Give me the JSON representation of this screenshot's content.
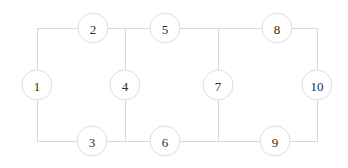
{
  "figure": {
    "title": "",
    "background_color": "#ffffff",
    "width": 348,
    "height": 168
  },
  "graph": {
    "type": "undirected-graph",
    "node_count": 10,
    "edge_count": 13,
    "node_radius": 15,
    "node_fill": "#ffffff",
    "node_stroke": "#dcdcdc",
    "edge_stroke": "#d9d9d9",
    "label_color": "#2b2b2b",
    "nodes": [
      {
        "id": "1",
        "label": "1",
        "x": 37,
        "y": 85
      },
      {
        "id": "2",
        "label": "2",
        "x": 93,
        "y": 28
      },
      {
        "id": "3",
        "label": "3",
        "x": 92,
        "y": 141
      },
      {
        "id": "4",
        "label": "4",
        "x": 125,
        "y": 85
      },
      {
        "id": "5",
        "label": "5",
        "x": 165,
        "y": 28
      },
      {
        "id": "6",
        "label": "6",
        "x": 165,
        "y": 141
      },
      {
        "id": "7",
        "label": "7",
        "x": 218,
        "y": 85
      },
      {
        "id": "8",
        "label": "8",
        "x": 277,
        "y": 28
      },
      {
        "id": "9",
        "label": "9",
        "x": 275,
        "y": 141
      },
      {
        "id": "10",
        "label": "10",
        "x": 317,
        "y": 85
      }
    ],
    "edges": [
      {
        "from": "1",
        "to": "2",
        "path": "M 37 85 L 37 28 L 93 28"
      },
      {
        "from": "1",
        "to": "3",
        "path": "M 37 85 L 37 141 L 92 141"
      },
      {
        "from": "2",
        "to": "4",
        "path": "M 93 28 L 125 28 L 125 85"
      },
      {
        "from": "2",
        "to": "5",
        "path": "M 93 28 L 165 28"
      },
      {
        "from": "3",
        "to": "4",
        "path": "M 92 141 L 125 141 L 125 85"
      },
      {
        "from": "3",
        "to": "6",
        "path": "M 92 141 L 165 141"
      },
      {
        "from": "5",
        "to": "7",
        "path": "M 165 28 L 218 28 L 218 85"
      },
      {
        "from": "5",
        "to": "8",
        "path": "M 165 28 L 277 28"
      },
      {
        "from": "6",
        "to": "7",
        "path": "M 165 141 L 218 141 L 218 85"
      },
      {
        "from": "6",
        "to": "9",
        "path": "M 165 141 L 275 141"
      },
      {
        "from": "8",
        "to": "10",
        "path": "M 277 28 L 317 28 L 317 85"
      },
      {
        "from": "9",
        "to": "10",
        "path": "M 275 141 L 317 141 L 317 85"
      },
      {
        "from": "8",
        "to": "9",
        "path": "M 277 28 L 277 28"
      }
    ]
  }
}
